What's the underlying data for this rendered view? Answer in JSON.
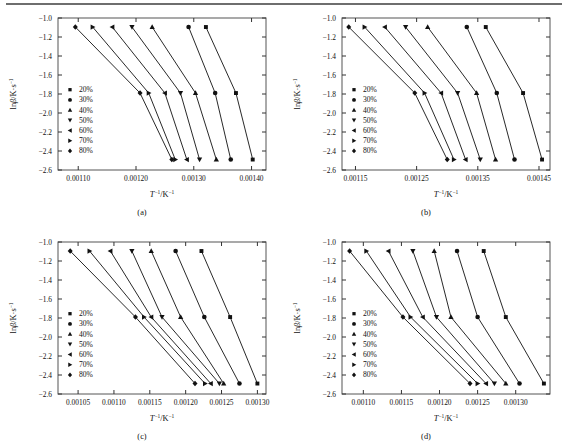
{
  "figure": {
    "y_axis_label": "lnβ/K·s",
    "y_axis_label_sup": "-1",
    "x_axis_label": "T",
    "x_axis_label_sup1": "-1",
    "x_axis_label_mid": "/K",
    "x_axis_label_sup2": "-1",
    "series_colors": {
      "line": "#111111",
      "marker": "#111111"
    },
    "legend_entries": [
      {
        "label": "20%",
        "marker": "square"
      },
      {
        "label": "30%",
        "marker": "circle"
      },
      {
        "label": "40%",
        "marker": "triangle-up"
      },
      {
        "label": "50%",
        "marker": "triangle-down"
      },
      {
        "label": "60%",
        "marker": "triangle-left"
      },
      {
        "label": "70%",
        "marker": "triangle-right"
      },
      {
        "label": "80%",
        "marker": "diamond"
      }
    ]
  },
  "chart_data": [
    {
      "type": "scatter",
      "panel": "(a)",
      "title": "",
      "xlabel": "T^-1/K^-1",
      "ylabel": "lnβ/K·s^-1",
      "xlim": [
        0.001065,
        0.001425
      ],
      "ylim": [
        -2.6,
        -1.0
      ],
      "xticks": [
        0.0011,
        0.0012,
        0.0013,
        0.0014
      ],
      "xticklabels": [
        "0.00110",
        "0.00120",
        "0.00130",
        "0.00140"
      ],
      "yticks": [
        -1.0,
        -1.2,
        -1.4,
        -1.6,
        -1.8,
        -2.0,
        -2.2,
        -2.4,
        -2.6
      ],
      "yticklabels": [
        "-1.0",
        "-1.2",
        "-1.4",
        "-1.6",
        "-1.8",
        "-2.0",
        "-2.2",
        "-2.4",
        "-2.6"
      ],
      "grid": false,
      "legend_position": "center-left",
      "y_values": [
        -1.095,
        -1.79,
        -2.49
      ],
      "series": [
        {
          "name": "20%",
          "marker": "square",
          "x": [
            0.001321,
            0.001373,
            0.001402
          ]
        },
        {
          "name": "30%",
          "marker": "circle",
          "x": [
            0.001291,
            0.001337,
            0.001364
          ]
        },
        {
          "name": "40%",
          "marker": "triangle-up",
          "x": [
            0.001228,
            0.001303,
            0.001339
          ]
        },
        {
          "name": "50%",
          "marker": "triangle-down",
          "x": [
            0.001193,
            0.001277,
            0.00131
          ]
        },
        {
          "name": "60%",
          "marker": "triangle-left",
          "x": [
            0.001159,
            0.00125,
            0.001288
          ]
        },
        {
          "name": "70%",
          "marker": "triangle-right",
          "x": [
            0.001125,
            0.001222,
            0.001268
          ]
        },
        {
          "name": "80%",
          "marker": "diamond",
          "x": [
            0.001095,
            0.001207,
            0.001262
          ]
        }
      ]
    },
    {
      "type": "scatter",
      "panel": "(b)",
      "title": "",
      "xlabel": "T^-1/K^-1",
      "ylabel": "lnβ/K·s^-1",
      "xlim": [
        0.001128,
        0.001468
      ],
      "ylim": [
        -2.6,
        -1.0
      ],
      "xticks": [
        0.00115,
        0.00125,
        0.00135,
        0.00145
      ],
      "xticklabels": [
        "0.00115",
        "0.00125",
        "0.00135",
        "0.00145"
      ],
      "yticks": [
        -1.0,
        -1.2,
        -1.4,
        -1.6,
        -1.8,
        -2.0,
        -2.2,
        -2.4,
        -2.6
      ],
      "yticklabels": [
        "-1.0",
        "-1.2",
        "-1.4",
        "-1.6",
        "-1.8",
        "-2.0",
        "-2.2",
        "-2.4",
        "-2.6"
      ],
      "grid": false,
      "legend_position": "center-left",
      "y_values": [
        -1.095,
        -1.79,
        -2.49
      ],
      "series": [
        {
          "name": "20%",
          "marker": "square",
          "x": [
            0.001363,
            0.001424,
            0.001455
          ]
        },
        {
          "name": "30%",
          "marker": "circle",
          "x": [
            0.001332,
            0.001381,
            0.00141
          ]
        },
        {
          "name": "40%",
          "marker": "triangle-up",
          "x": [
            0.001268,
            0.001348,
            0.001379
          ]
        },
        {
          "name": "50%",
          "marker": "triangle-down",
          "x": [
            0.001232,
            0.001317,
            0.001354
          ]
        },
        {
          "name": "60%",
          "marker": "triangle-left",
          "x": [
            0.001198,
            0.00129,
            0.00133
          ]
        },
        {
          "name": "70%",
          "marker": "triangle-right",
          "x": [
            0.001165,
            0.001263,
            0.001311
          ]
        },
        {
          "name": "80%",
          "marker": "diamond",
          "x": [
            0.001139,
            0.001247,
            0.0013
          ]
        }
      ]
    },
    {
      "type": "scatter",
      "panel": "(c)",
      "title": "",
      "xlabel": "T^-1/K^-1",
      "ylabel": "lnβ/K·s^-1",
      "xlim": [
        0.001022,
        0.001312
      ],
      "ylim": [
        -2.6,
        -1.0
      ],
      "xticks": [
        0.00105,
        0.0011,
        0.00115,
        0.0012,
        0.00125,
        0.0013
      ],
      "xticklabels": [
        "0.00105",
        "0.00110",
        "0.00115",
        "0.00120",
        "0.00125",
        "0.00130"
      ],
      "yticks": [
        -1.0,
        -1.2,
        -1.4,
        -1.6,
        -1.8,
        -2.0,
        -2.2,
        -2.4,
        -2.6
      ],
      "yticklabels": [
        "-1.0",
        "-1.2",
        "-1.4",
        "-1.6",
        "-1.8",
        "-2.0",
        "-2.2",
        "-2.4",
        "-2.6"
      ],
      "grid": false,
      "legend_position": "center-left",
      "y_values": [
        -1.095,
        -1.79,
        -2.49
      ],
      "series": [
        {
          "name": "20%",
          "marker": "square",
          "x": [
            0.001222,
            0.001262,
            0.0013
          ]
        },
        {
          "name": "30%",
          "marker": "circle",
          "x": [
            0.001186,
            0.001226,
            0.001275
          ]
        },
        {
          "name": "40%",
          "marker": "triangle-up",
          "x": [
            0.001152,
            0.001193,
            0.001253
          ]
        },
        {
          "name": "50%",
          "marker": "triangle-down",
          "x": [
            0.001125,
            0.001167,
            0.001247
          ]
        },
        {
          "name": "60%",
          "marker": "triangle-left",
          "x": [
            0.001095,
            0.001152,
            0.001235
          ]
        },
        {
          "name": "70%",
          "marker": "triangle-right",
          "x": [
            0.001066,
            0.001142,
            0.001227
          ]
        },
        {
          "name": "80%",
          "marker": "diamond",
          "x": [
            0.001039,
            0.00113,
            0.001213
          ]
        }
      ]
    },
    {
      "type": "scatter",
      "panel": "(d)",
      "title": "",
      "xlabel": "T^-1/K^-1",
      "ylabel": "lnβ/K·s^-1",
      "xlim": [
        0.001072,
        0.001345
      ],
      "ylim": [
        -2.6,
        -1.0
      ],
      "xticks": [
        0.0011,
        0.00115,
        0.0012,
        0.00125,
        0.0013
      ],
      "xticklabels": [
        "0.00110",
        "0.00115",
        "0.00120",
        "0.00125",
        "0.00130"
      ],
      "yticks": [
        -1.0,
        -1.2,
        -1.4,
        -1.6,
        -1.8,
        -2.0,
        -2.2,
        -2.4,
        -2.6
      ],
      "yticklabels": [
        "-1.0",
        "-1.2",
        "-1.4",
        "-1.6",
        "-1.8",
        "-2.0",
        "-2.2",
        "-2.4",
        "-2.6"
      ],
      "grid": false,
      "legend_position": "center-left",
      "y_values": [
        -1.095,
        -1.79,
        -2.49
      ],
      "series": [
        {
          "name": "20%",
          "marker": "square",
          "x": [
            0.001258,
            0.001287,
            0.001337
          ]
        },
        {
          "name": "30%",
          "marker": "circle",
          "x": [
            0.001223,
            0.00125,
            0.001305
          ]
        },
        {
          "name": "40%",
          "marker": "triangle-up",
          "x": [
            0.001193,
            0.001215,
            0.001287
          ]
        },
        {
          "name": "50%",
          "marker": "triangle-down",
          "x": [
            0.001165,
            0.001196,
            0.001272
          ]
        },
        {
          "name": "60%",
          "marker": "triangle-left",
          "x": [
            0.001133,
            0.001178,
            0.001261
          ]
        },
        {
          "name": "70%",
          "marker": "triangle-right",
          "x": [
            0.001104,
            0.001162,
            0.00125
          ]
        },
        {
          "name": "80%",
          "marker": "diamond",
          "x": [
            0.001082,
            0.001152,
            0.00124
          ]
        }
      ]
    }
  ]
}
